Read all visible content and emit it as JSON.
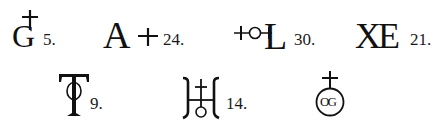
{
  "symbols": [
    {
      "id": "g-cross",
      "letters": "G",
      "number": "5.",
      "description": "letter G with cross above"
    },
    {
      "id": "a-cross",
      "letters": "A",
      "number": "24.",
      "description": "letter A with cross to the right"
    },
    {
      "id": "cross-circle-l",
      "letters": "L",
      "number": "30.",
      "description": "cross, circle, then letter L"
    },
    {
      "id": "xe",
      "letters": "XE",
      "number": "21.",
      "description": "ligature XE"
    },
    {
      "id": "t-circle",
      "letters": "T",
      "number": "9.",
      "description": "letter T with circle on stem"
    },
    {
      "id": "brackets-cross-circle",
      "letters": "",
      "number": "14.",
      "description": "brackets with cross and circle (H-like)"
    },
    {
      "id": "cross-circle-og",
      "letters": "OG",
      "number": "",
      "description": "cross above circle enclosing OG"
    }
  ],
  "colors": {
    "ink": "#111111",
    "background": "#ffffff"
  }
}
